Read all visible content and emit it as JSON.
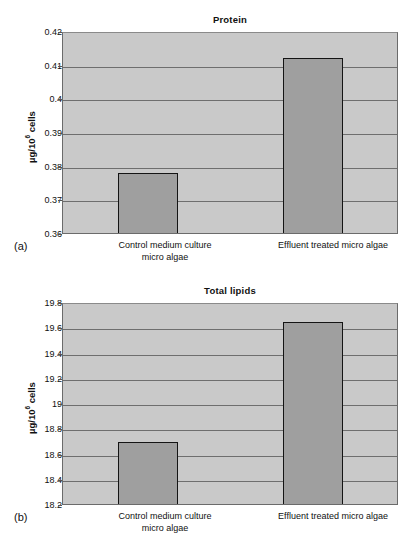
{
  "figure": {
    "panels": [
      {
        "panel_label": "(a)",
        "title": "Protein",
        "yaxis_title_main": "µg/10",
        "yaxis_title_sup": "6",
        "yaxis_title_tail": " cells",
        "ticks": [
          "0.42",
          "0.41",
          "0.4",
          "0.39",
          "0.38",
          "0.37",
          "0.36"
        ],
        "categories": [
          "Control medium culture\nmicro algae",
          "Effluent treated micro algae"
        ],
        "values": [
          0.3785,
          0.4125
        ],
        "ymin": 0.36,
        "ymax": 0.42
      },
      {
        "panel_label": "(b)",
        "title": "Total lipids",
        "yaxis_title_main": "µg/10",
        "yaxis_title_sup": "6",
        "yaxis_title_tail": " cells",
        "ticks": [
          "19.8",
          "19.6",
          "19.4",
          "19.2",
          "19",
          "18.8",
          "18.6",
          "18.4",
          "18.2"
        ],
        "categories": [
          "Control medium culture\nmicro algae",
          "Effluent treated micro algae"
        ],
        "values": [
          18.71,
          19.66
        ],
        "ymin": 18.2,
        "ymax": 19.8
      }
    ]
  },
  "chart_data": [
    {
      "type": "bar",
      "title": "Protein",
      "panel": "(a)",
      "categories": [
        "Control medium culture micro algae",
        "Effluent treated micro algae"
      ],
      "values": [
        0.3785,
        0.4125
      ],
      "xlabel": "",
      "ylabel": "µg/10^6 cells",
      "ylim": [
        0.36,
        0.42
      ],
      "ytick_labels": [
        "0.36",
        "0.37",
        "0.38",
        "0.39",
        "0.4",
        "0.41",
        "0.42"
      ],
      "ytick_step": 0.01,
      "grid": true,
      "legend": "none",
      "bar_facecolor": "#9f9f9f",
      "bar_edgecolor": "#141414",
      "plot_background": "#c9c9c9"
    },
    {
      "type": "bar",
      "title": "Total lipids",
      "panel": "(b)",
      "categories": [
        "Control medium culture micro algae",
        "Effluent treated micro algae"
      ],
      "values": [
        18.71,
        19.66
      ],
      "xlabel": "",
      "ylabel": "µg/10^6 cells",
      "ylim": [
        18.2,
        19.8
      ],
      "ytick_labels": [
        "18.2",
        "18.4",
        "18.6",
        "18.8",
        "19",
        "19.2",
        "19.4",
        "19.6",
        "19.8"
      ],
      "ytick_step": 0.2,
      "grid": true,
      "legend": "none",
      "bar_facecolor": "#9f9f9f",
      "bar_edgecolor": "#141414",
      "plot_background": "#c9c9c9"
    }
  ]
}
